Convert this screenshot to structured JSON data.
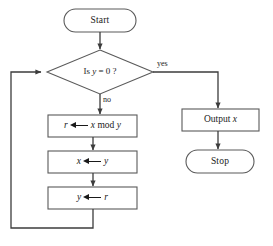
{
  "diagram": {
    "type": "flowchart",
    "colors": {
      "background": "#ffffff",
      "stroke": "#5a5a5a",
      "text": "#1a1a1a",
      "arrow": "#3c3c3c"
    }
  },
  "header_ghost": "",
  "nodes": {
    "start": {
      "shape": "terminal",
      "label": "Start"
    },
    "decision": {
      "shape": "diamond",
      "prefix": "Is ",
      "variable": "y",
      "suffix": " = 0 ?",
      "label": "Is y = 0 ?"
    },
    "process_mod": {
      "shape": "process",
      "lhs": "r",
      "rhs_var": "x",
      "rhs_op": "mod",
      "rhs_var2": "y",
      "label": "r ⟵ x mod y"
    },
    "process_xy": {
      "shape": "process",
      "lhs": "x",
      "rhs": "y",
      "label": "x ⟵ y"
    },
    "process_yr": {
      "shape": "process",
      "lhs": "y",
      "rhs": "r",
      "label": "y ⟵ r"
    },
    "output": {
      "shape": "process",
      "prefix": "Output ",
      "variable": "x",
      "label": "Output x"
    },
    "stop": {
      "shape": "terminal",
      "label": "Stop"
    }
  },
  "edges": {
    "yes_label": "yes",
    "no_label": "no"
  }
}
